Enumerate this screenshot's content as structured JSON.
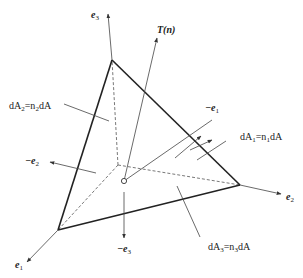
{
  "figure": {
    "type": "tetrahedron-stress-diagram",
    "colors": {
      "edge": "#222222",
      "axis": "#444444",
      "background": "#ffffff"
    },
    "axes": [
      {
        "id": "e3",
        "label": "e",
        "sub": "3"
      },
      {
        "id": "e1",
        "label": "e",
        "sub": "1"
      },
      {
        "id": "e2",
        "label": "e",
        "sub": "2"
      }
    ],
    "normals": [
      {
        "id": "neg-e1",
        "label": "−e",
        "sub": "1"
      },
      {
        "id": "neg-e2",
        "label": "−e",
        "sub": "2"
      },
      {
        "id": "neg-e3",
        "label": "−e",
        "sub": "3"
      }
    ],
    "traction": {
      "label": "T(n)"
    },
    "areas": [
      {
        "id": "dA1",
        "pre": "dA",
        "sub": "1",
        "eq": "=n",
        "sub2": "1",
        "post": "dA"
      },
      {
        "id": "dA2",
        "pre": "dA",
        "sub": "2",
        "eq": "=n",
        "sub2": "2",
        "post": "dA"
      },
      {
        "id": "dA3",
        "pre": "dA",
        "sub": "3",
        "eq": "=n",
        "sub2": "3",
        "post": "dA"
      }
    ]
  }
}
